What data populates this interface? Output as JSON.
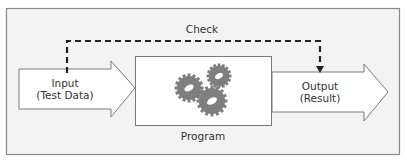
{
  "diagram": {
    "check_label": "Check",
    "input_label_line1": "Input",
    "input_label_line2": "(Test Data)",
    "program_label": "Program",
    "output_label_line1": "Output",
    "output_label_line2": "(Result)",
    "program_icon": "gears-icon",
    "colors": {
      "frame_fill": "#f3f3f3",
      "frame_stroke": "#8a8a8a",
      "shape_fill": "#ffffff",
      "shape_stroke": "#7a7a7a",
      "dash": "#222222",
      "gear": "#7f7f7f",
      "text": "#333333"
    }
  }
}
